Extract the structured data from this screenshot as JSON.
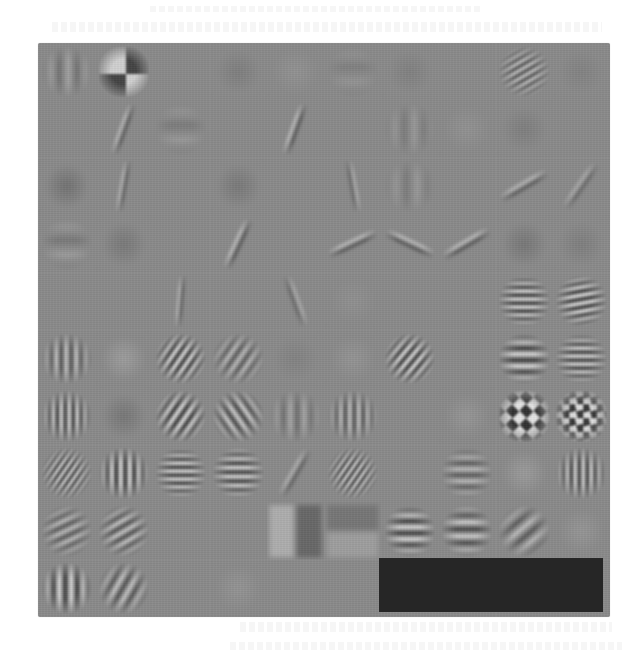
{
  "figure": {
    "grid": {
      "rows": 10,
      "cols": 10,
      "filled_cells": 96,
      "empty_cells": 4
    },
    "colors": {
      "background_gray": "#8a8a8a",
      "empty_block": "#262626",
      "light": "#d8d8d8",
      "dark": "#3a3a3a",
      "page": "#ffffff"
    },
    "cells": [
      {
        "t": "stripes",
        "a": 90,
        "p": 18,
        "c": 0.25
      },
      {
        "t": "checker",
        "a": 0,
        "p": 28,
        "c": 0.7
      },
      {
        "t": "flat"
      },
      {
        "t": "blob",
        "c": -0.12
      },
      {
        "t": "blob",
        "c": 0.08
      },
      {
        "t": "stripes",
        "a": 0,
        "p": 30,
        "c": 0.1
      },
      {
        "t": "blob",
        "c": -0.1
      },
      {
        "t": "flat"
      },
      {
        "t": "stripes",
        "a": -30,
        "p": 7,
        "c": 0.6
      },
      {
        "t": "blob",
        "c": -0.08
      },
      {
        "t": "flat"
      },
      {
        "t": "line",
        "a": -70,
        "p": 10,
        "c": 0.4
      },
      {
        "t": "stripes",
        "a": 0,
        "p": 30,
        "c": -0.15
      },
      {
        "t": "flat"
      },
      {
        "t": "line",
        "a": -70,
        "p": 10,
        "c": 0.45
      },
      {
        "t": "flat"
      },
      {
        "t": "stripes",
        "a": 90,
        "p": 20,
        "c": 0.15
      },
      {
        "t": "blob",
        "c": 0.08
      },
      {
        "t": "blob",
        "c": -0.12
      },
      {
        "t": "flat"
      },
      {
        "t": "blob",
        "c": -0.25
      },
      {
        "t": "line",
        "a": -80,
        "p": 10,
        "c": 0.35
      },
      {
        "t": "flat"
      },
      {
        "t": "blob",
        "c": -0.18
      },
      {
        "t": "flat"
      },
      {
        "t": "line",
        "a": 80,
        "p": 12,
        "c": 0.3
      },
      {
        "t": "stripes",
        "a": 90,
        "p": 22,
        "c": 0.15
      },
      {
        "t": "flat"
      },
      {
        "t": "line",
        "a": -30,
        "p": 12,
        "c": 0.4
      },
      {
        "t": "line",
        "a": -55,
        "p": 12,
        "c": 0.3
      },
      {
        "t": "stripes",
        "a": 0,
        "p": 30,
        "c": -0.18
      },
      {
        "t": "blob",
        "c": -0.18
      },
      {
        "t": "flat"
      },
      {
        "t": "line",
        "a": -65,
        "p": 10,
        "c": 0.45
      },
      {
        "t": "flat"
      },
      {
        "t": "line",
        "a": -25,
        "p": 10,
        "c": 0.45
      },
      {
        "t": "line",
        "a": 25,
        "p": 10,
        "c": 0.45
      },
      {
        "t": "line",
        "a": -30,
        "p": 10,
        "c": 0.45
      },
      {
        "t": "blob",
        "c": -0.2
      },
      {
        "t": "blob",
        "c": -0.12
      },
      {
        "t": "flat"
      },
      {
        "t": "flat"
      },
      {
        "t": "line",
        "a": -85,
        "p": 10,
        "c": 0.35
      },
      {
        "t": "flat"
      },
      {
        "t": "line",
        "a": 70,
        "p": 10,
        "c": 0.3
      },
      {
        "t": "blob",
        "c": 0.06
      },
      {
        "t": "flat"
      },
      {
        "t": "flat"
      },
      {
        "t": "stripes",
        "a": 0,
        "p": 8,
        "c": 0.9
      },
      {
        "t": "stripes",
        "a": -10,
        "p": 8,
        "c": 0.9
      },
      {
        "t": "stripes",
        "a": 90,
        "p": 10,
        "c": 0.6
      },
      {
        "t": "blob",
        "c": 0.2
      },
      {
        "t": "stripes",
        "a": -55,
        "p": 8,
        "c": 0.9
      },
      {
        "t": "stripes",
        "a": -55,
        "p": 10,
        "c": 0.5
      },
      {
        "t": "blob",
        "c": -0.08
      },
      {
        "t": "blob",
        "c": 0.1
      },
      {
        "t": "stripes",
        "a": -50,
        "p": 8,
        "c": 0.9
      },
      {
        "t": "flat"
      },
      {
        "t": "stripes",
        "a": 0,
        "p": 12,
        "c": 0.85
      },
      {
        "t": "stripes",
        "a": 0,
        "p": 8,
        "c": 0.85
      },
      {
        "t": "stripes",
        "a": 90,
        "p": 8,
        "c": 0.8
      },
      {
        "t": "blob",
        "c": -0.2
      },
      {
        "t": "stripes",
        "a": -55,
        "p": 9,
        "c": 0.9
      },
      {
        "t": "stripes",
        "a": 55,
        "p": 10,
        "c": 0.7
      },
      {
        "t": "stripes",
        "a": 90,
        "p": 14,
        "c": 0.3
      },
      {
        "t": "stripes",
        "a": 90,
        "p": 9,
        "c": 0.6
      },
      {
        "t": "flat"
      },
      {
        "t": "blob",
        "c": 0.12
      },
      {
        "t": "checker",
        "a": 45,
        "p": 7,
        "c": 0.9
      },
      {
        "t": "checker",
        "a": 80,
        "p": 7,
        "c": 0.85
      },
      {
        "t": "stripes",
        "a": -55,
        "p": 6,
        "c": 0.85
      },
      {
        "t": "stripes",
        "a": 90,
        "p": 9,
        "c": 0.9
      },
      {
        "t": "stripes",
        "a": 0,
        "p": 8,
        "c": 0.85
      },
      {
        "t": "stripes",
        "a": 0,
        "p": 9,
        "c": 0.8
      },
      {
        "t": "line",
        "a": -60,
        "p": 10,
        "c": 0.35
      },
      {
        "t": "stripes",
        "a": -55,
        "p": 6,
        "c": 0.85
      },
      {
        "t": "flat"
      },
      {
        "t": "stripes",
        "a": 0,
        "p": 12,
        "c": 0.5
      },
      {
        "t": "blob",
        "c": 0.18
      },
      {
        "t": "stripes",
        "a": 90,
        "p": 8,
        "c": 0.8
      },
      {
        "t": "stripes",
        "a": -25,
        "p": 10,
        "c": 0.5
      },
      {
        "t": "stripes",
        "a": -30,
        "p": 10,
        "c": 0.6
      },
      {
        "t": "flat"
      },
      {
        "t": "flat"
      },
      {
        "t": "edge",
        "a": 90,
        "c": 0.35
      },
      {
        "t": "edge",
        "a": 0,
        "c": 0.2
      },
      {
        "t": "stripes",
        "a": 0,
        "p": 12,
        "c": 0.8
      },
      {
        "t": "stripes",
        "a": 0,
        "p": 14,
        "c": 0.7
      },
      {
        "t": "stripes",
        "a": -40,
        "p": 16,
        "c": 0.5
      },
      {
        "t": "blob",
        "c": 0.12
      },
      {
        "t": "stripes",
        "a": 90,
        "p": 12,
        "c": 0.85
      },
      {
        "t": "stripes",
        "a": -60,
        "p": 12,
        "c": 0.6
      },
      {
        "t": "flat"
      },
      {
        "t": "blob",
        "c": 0.1
      },
      {
        "t": "flat"
      },
      {
        "t": "flat"
      },
      {
        "t": "empty"
      },
      {
        "t": "empty"
      },
      {
        "t": "empty"
      },
      {
        "t": "empty"
      }
    ]
  }
}
